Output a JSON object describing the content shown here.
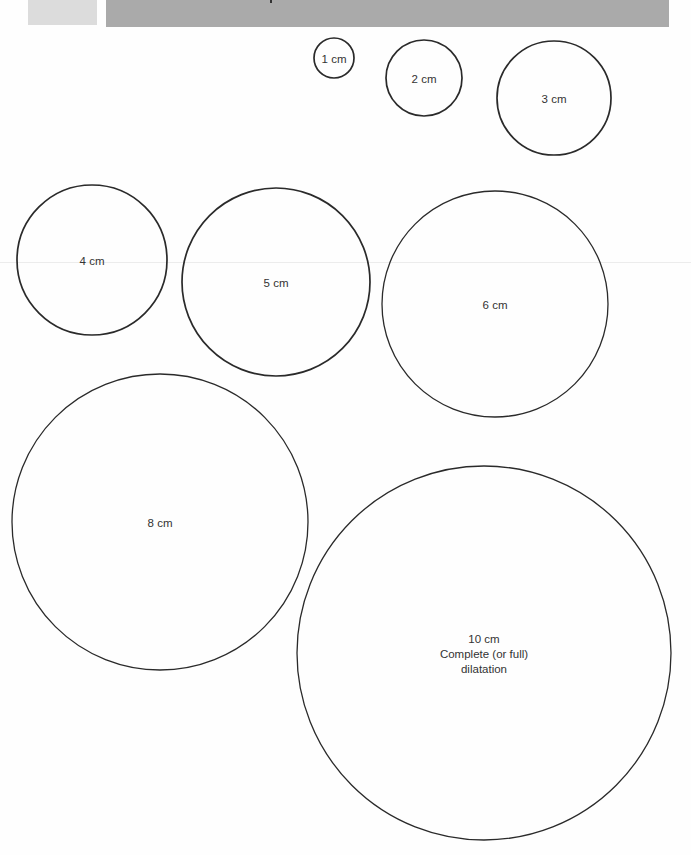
{
  "header": {
    "light_block_color": "#dcdcdc",
    "bar_color": "#aaaaaa"
  },
  "diagram": {
    "stroke_color": "#2a2a2a",
    "circles": [
      {
        "id": "1cm",
        "label": "1 cm",
        "cx": 334,
        "cy": 58,
        "r": 20
      },
      {
        "id": "2cm",
        "label": "2 cm",
        "cx": 424,
        "cy": 78,
        "r": 38
      },
      {
        "id": "3cm",
        "label": "3 cm",
        "cx": 554,
        "cy": 98,
        "r": 57
      },
      {
        "id": "4cm",
        "label": "4 cm",
        "cx": 92,
        "cy": 260,
        "r": 75
      },
      {
        "id": "5cm",
        "label": "5 cm",
        "cx": 276,
        "cy": 282,
        "r": 94
      },
      {
        "id": "6cm",
        "label": "6 cm",
        "cx": 495,
        "cy": 304,
        "r": 113
      },
      {
        "id": "8cm",
        "label": "8 cm",
        "cx": 160,
        "cy": 522,
        "r": 148
      },
      {
        "id": "10cm",
        "label": "10 cm",
        "sublabel_1": "Complete (or full)",
        "sublabel_2": "dilatation",
        "cx": 484,
        "cy": 653,
        "r": 187
      }
    ]
  }
}
